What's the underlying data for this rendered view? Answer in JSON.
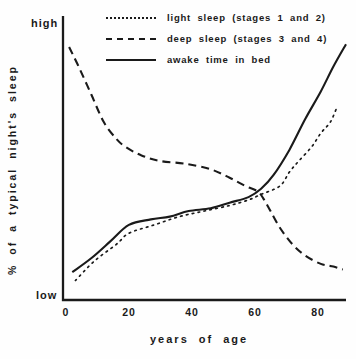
{
  "figure": {
    "high_label": "high",
    "low_label": "low"
  },
  "chart_data": {
    "type": "line",
    "title": "",
    "xlabel": "years of age",
    "ylabel": "% of a typical night's sleep",
    "x_ticks": [
      "0",
      "20",
      "40",
      "60",
      "80"
    ],
    "y_tick_labels": [
      "low",
      "high"
    ],
    "xlim": [
      0,
      90
    ],
    "ylim": [
      0,
      100
    ],
    "grid": false,
    "legend_position": "top",
    "background_color": "#fefefe",
    "line_color": "#1a1a1a",
    "series": [
      {
        "name": "light sleep (stages 1 and 2)",
        "line_style": "dotted",
        "color": "#1a1a1a",
        "points": [
          [
            3,
            7
          ],
          [
            9,
            14
          ],
          [
            16,
            20
          ],
          [
            20,
            24
          ],
          [
            28,
            27
          ],
          [
            36,
            30
          ],
          [
            44,
            32
          ],
          [
            52,
            34
          ],
          [
            58,
            36
          ],
          [
            62,
            38
          ],
          [
            68,
            41
          ],
          [
            71,
            46
          ],
          [
            74,
            50
          ],
          [
            78,
            55
          ],
          [
            81,
            60
          ],
          [
            84,
            64
          ],
          [
            86,
            69
          ]
        ]
      },
      {
        "name": "deep sleep (stages 3 and 4)",
        "line_style": "dashed",
        "color": "#1a1a1a",
        "points": [
          [
            1,
            91
          ],
          [
            4,
            84
          ],
          [
            8,
            74
          ],
          [
            12,
            64
          ],
          [
            16,
            58
          ],
          [
            19,
            55
          ],
          [
            24,
            52
          ],
          [
            30,
            50
          ],
          [
            38,
            49
          ],
          [
            46,
            47
          ],
          [
            52,
            44
          ],
          [
            57,
            41
          ],
          [
            61,
            39
          ],
          [
            63,
            36
          ],
          [
            65,
            32
          ],
          [
            68,
            26
          ],
          [
            72,
            20
          ],
          [
            76,
            16
          ],
          [
            81,
            13
          ],
          [
            85,
            12
          ],
          [
            88,
            11
          ]
        ]
      },
      {
        "name": "awake time in bed",
        "line_style": "solid",
        "color": "#1a1a1a",
        "points": [
          [
            2,
            10
          ],
          [
            8,
            15
          ],
          [
            14,
            21
          ],
          [
            20,
            27
          ],
          [
            27,
            29
          ],
          [
            33,
            30
          ],
          [
            39,
            32
          ],
          [
            46,
            33
          ],
          [
            52,
            35
          ],
          [
            58,
            37
          ],
          [
            62,
            40
          ],
          [
            66,
            45
          ],
          [
            71,
            54
          ],
          [
            76,
            65
          ],
          [
            81,
            75
          ],
          [
            85,
            84
          ],
          [
            89,
            92
          ]
        ]
      }
    ]
  }
}
